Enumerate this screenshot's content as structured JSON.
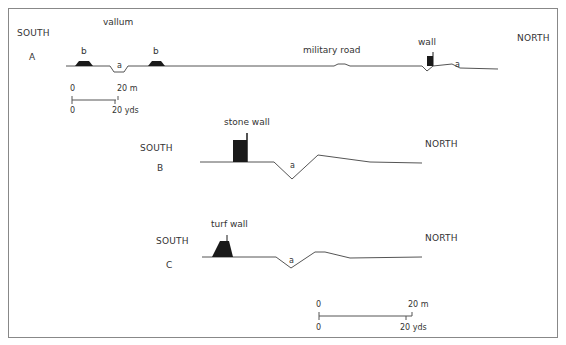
{
  "profile_a": {
    "id": "A",
    "south": "SOUTH",
    "north": "NORTH",
    "vallum": "vallum",
    "mound_left": "b",
    "mound_right": "b",
    "ditch_vallum": "a",
    "military_road": "military road",
    "wall": "wall",
    "ditch_north": "a"
  },
  "profile_b": {
    "id": "B",
    "south": "SOUTH",
    "north": "NORTH",
    "wall": "stone wall",
    "ditch": "a"
  },
  "profile_c": {
    "id": "C",
    "south": "SOUTH",
    "north": "NORTH",
    "wall": "turf wall",
    "ditch": "a"
  },
  "scale_top": {
    "m_zero": "0",
    "m_end": "20 m",
    "yd_zero": "0",
    "yd_end": "20 yds"
  },
  "scale_bottom": {
    "m_zero": "0",
    "m_end": "20 m",
    "yd_zero": "0",
    "yd_end": "20 yds"
  },
  "colors": {
    "line": "#555555",
    "fill": "#1a1a1a",
    "border": "#888888"
  }
}
